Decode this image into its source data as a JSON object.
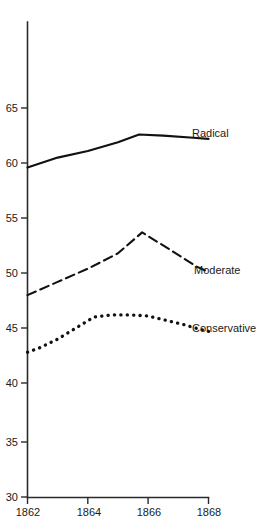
{
  "chart_data": {
    "type": "line",
    "title": "",
    "subtitle": "",
    "xlabel": "",
    "ylabel": "",
    "xlim": [
      1862,
      1868
    ],
    "ylim": [
      30,
      67.5
    ],
    "grid": false,
    "legend_position": "inline-right-of-line-ends",
    "x_ticks": [
      "1862",
      "1864",
      "1866",
      "1868"
    ],
    "x_tick_values": [
      1862,
      1864,
      1866,
      1868
    ],
    "y_ticks": [
      "65",
      "60",
      "55",
      "50",
      "45",
      "40",
      "35",
      "30"
    ],
    "y_tick_values": [
      65,
      60,
      55,
      50,
      45,
      40,
      35,
      30
    ],
    "series": [
      {
        "name": "Radical",
        "style": "solid",
        "x": [
          1862,
          1863,
          1864,
          1865,
          1865.7,
          1866.5,
          1867.5,
          1868
        ],
        "values": [
          60.0,
          60.9,
          61.5,
          62.3,
          63.0,
          62.9,
          62.7,
          62.6
        ]
      },
      {
        "name": "Moderate",
        "style": "dashed",
        "x": [
          1862,
          1863,
          1864,
          1865,
          1865.8,
          1866.8,
          1867.6,
          1868
        ],
        "values": [
          48.4,
          49.6,
          50.8,
          52.2,
          54.1,
          52.4,
          51.0,
          50.5
        ]
      },
      {
        "name": "Conservative",
        "style": "dotted",
        "x": [
          1862,
          1862.4,
          1863.0,
          1863.6,
          1864.2,
          1864.8,
          1865.4,
          1866.0,
          1866.6,
          1867.2,
          1867.7,
          1868
        ],
        "values": [
          43.2,
          43.6,
          44.4,
          45.4,
          46.4,
          46.6,
          46.6,
          46.5,
          46.1,
          45.7,
          45.3,
          45.1
        ]
      }
    ],
    "annotations": [
      {
        "text": "Radical",
        "at_x": 1868,
        "at_y": 62.6
      },
      {
        "text": "Moderate",
        "at_x": 1868,
        "at_y": 50.5
      },
      {
        "text": "Conservative",
        "at_x": 1868,
        "at_y": 45.1
      }
    ]
  },
  "axes": {
    "y_label_0": "65",
    "y_label_1": "60",
    "y_label_2": "55",
    "y_label_3": "50",
    "y_label_4": "45",
    "y_label_5": "40",
    "y_label_6": "35",
    "y_label_7": "30",
    "x_label_0": "1862",
    "x_label_1": "1864",
    "x_label_2": "1866",
    "x_label_3": "1868"
  },
  "labels": {
    "radical": "Radical",
    "moderate": "Moderate",
    "conservative": "Conservative"
  },
  "colors": {
    "ink": "#1a1a1a",
    "axis": "#2b2b2b",
    "background": "#ffffff"
  }
}
